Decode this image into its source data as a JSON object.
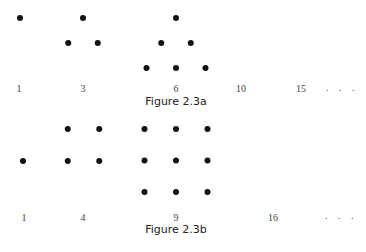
{
  "figures": [
    {
      "caption": "Figure 2.3a",
      "sequence_name": "triangular numbers",
      "terms": [
        {
          "label": "1",
          "shape": "triangle",
          "rows": [
            1
          ]
        },
        {
          "label": "3",
          "shape": "triangle",
          "rows": [
            1,
            2
          ]
        },
        {
          "label": "6",
          "shape": "triangle",
          "rows": [
            1,
            2,
            3
          ]
        },
        {
          "label": "10",
          "shape": "triangle",
          "rows": []
        },
        {
          "label": "15",
          "shape": "triangle",
          "rows": []
        }
      ],
      "ellipsis": ". . ."
    },
    {
      "caption": "Figure 2.3b",
      "sequence_name": "square numbers",
      "terms": [
        {
          "label": "1",
          "shape": "square",
          "side": 1
        },
        {
          "label": "4",
          "shape": "square",
          "side": 2
        },
        {
          "label": "9",
          "shape": "square",
          "side": 3
        },
        {
          "label": "16",
          "shape": "square",
          "side": 0
        }
      ],
      "ellipsis": ". . ."
    }
  ]
}
